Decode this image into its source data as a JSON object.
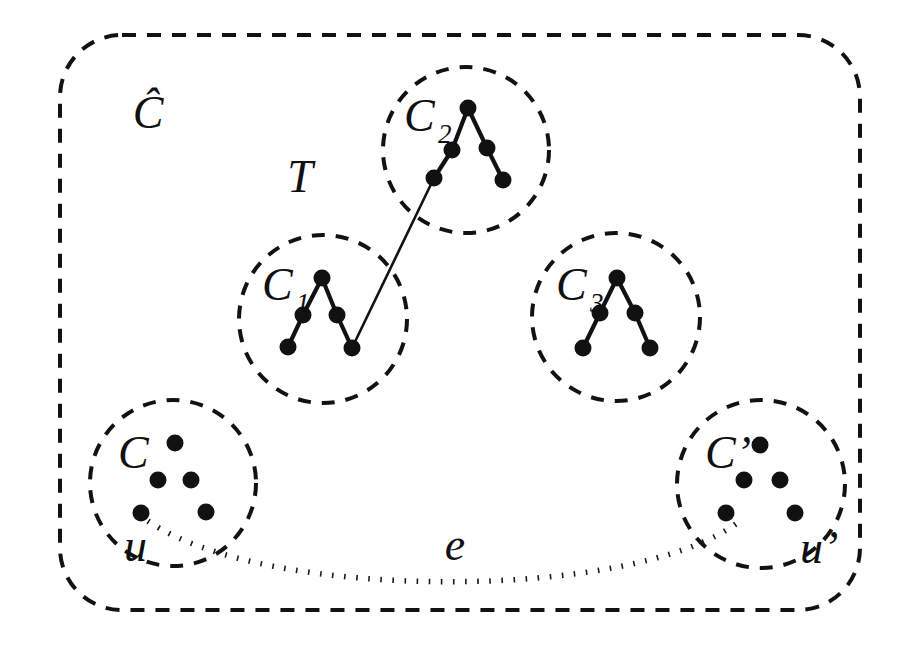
{
  "figure": {
    "kind": "graph-partition-diagram",
    "background_color": "#ffffff",
    "ink_color": "#121212",
    "outer_region": {
      "label": "Ĉ",
      "label_name": "outer-cluster-label",
      "style": "dashed-rounded-rectangle",
      "x": 60,
      "y": 35,
      "width": 800,
      "height": 575,
      "corner_radius": 62,
      "dash": "14 11",
      "stroke_width": 4,
      "label_x": 148,
      "label_y": 128
    },
    "tree_label": {
      "text": "T",
      "x": 300,
      "y": 192
    },
    "edge_label": {
      "text": "e",
      "x": 455,
      "y": 560
    },
    "clusters": [
      {
        "id": "c1",
        "label": "C",
        "subscript": "1",
        "label_x": 262,
        "label_y": 300,
        "sub_x": 296,
        "sub_y": 312,
        "cx": 323,
        "cy": 319,
        "r": 84,
        "dash": "13 11",
        "stroke_width": 4,
        "nodes": [
          {
            "x": 322,
            "y": 278
          },
          {
            "x": 303,
            "y": 315
          },
          {
            "x": 337,
            "y": 315
          },
          {
            "x": 288,
            "y": 347
          },
          {
            "x": 352,
            "y": 348
          }
        ],
        "edges": [
          [
            0,
            1
          ],
          [
            0,
            2
          ],
          [
            1,
            3
          ],
          [
            2,
            4
          ]
        ]
      },
      {
        "id": "c2",
        "label": "C",
        "subscript": "2",
        "label_x": 404,
        "label_y": 131,
        "sub_x": 438,
        "sub_y": 143,
        "cx": 466,
        "cy": 150,
        "r": 83,
        "dash": "13 11",
        "stroke_width": 4,
        "nodes": [
          {
            "x": 468,
            "y": 108
          },
          {
            "x": 452,
            "y": 150
          },
          {
            "x": 487,
            "y": 148
          },
          {
            "x": 434,
            "y": 178
          },
          {
            "x": 503,
            "y": 180
          }
        ],
        "edges": [
          [
            0,
            1
          ],
          [
            0,
            2
          ],
          [
            1,
            3
          ],
          [
            2,
            4
          ]
        ]
      },
      {
        "id": "c3",
        "label": "C",
        "subscript": "3",
        "label_x": 556,
        "label_y": 300,
        "sub_x": 590,
        "sub_y": 312,
        "cx": 616,
        "cy": 317,
        "r": 84,
        "dash": "13 11",
        "stroke_width": 4,
        "nodes": [
          {
            "x": 617,
            "y": 278
          },
          {
            "x": 600,
            "y": 313
          },
          {
            "x": 635,
            "y": 313
          },
          {
            "x": 583,
            "y": 348
          },
          {
            "x": 650,
            "y": 348
          }
        ],
        "edges": [
          [
            0,
            1
          ],
          [
            0,
            2
          ],
          [
            1,
            3
          ],
          [
            2,
            4
          ]
        ]
      },
      {
        "id": "c",
        "label": "C",
        "subscript": "",
        "label_x": 118,
        "label_y": 468,
        "sub_x": 0,
        "sub_y": 0,
        "cx": 173,
        "cy": 483,
        "r": 83,
        "dash": "13 11",
        "stroke_width": 4,
        "nodes": [
          {
            "x": 175,
            "y": 443
          },
          {
            "x": 158,
            "y": 480
          },
          {
            "x": 191,
            "y": 480
          },
          {
            "x": 141,
            "y": 513
          },
          {
            "x": 206,
            "y": 512
          }
        ],
        "edges": [],
        "vertex_label": {
          "text": "u",
          "x": 124,
          "y": 561
        }
      },
      {
        "id": "cprime",
        "label": "C’",
        "subscript": "",
        "label_x": 705,
        "label_y": 468,
        "sub_x": 0,
        "sub_y": 0,
        "cx": 761,
        "cy": 484,
        "r": 84,
        "dash": "13 11",
        "stroke_width": 4,
        "nodes": [
          {
            "x": 760,
            "y": 445
          },
          {
            "x": 744,
            "y": 480
          },
          {
            "x": 780,
            "y": 480
          },
          {
            "x": 726,
            "y": 513
          },
          {
            "x": 795,
            "y": 513
          }
        ],
        "edges": [],
        "vertex_label": {
          "text": "u’",
          "x": 800,
          "y": 563
        }
      }
    ],
    "tree_link": {
      "from": {
        "x": 352,
        "y": 348
      },
      "to": {
        "x": 434,
        "y": 178
      },
      "description": "solid line joining C1 to C2"
    },
    "dotted_edge": {
      "id": "e",
      "path": "M 148 521 C 260 600, 640 600, 740 520",
      "description": "dotted curve from u to u-prime"
    },
    "node_radius": 8.5,
    "free_dot_radius": 8.5
  }
}
